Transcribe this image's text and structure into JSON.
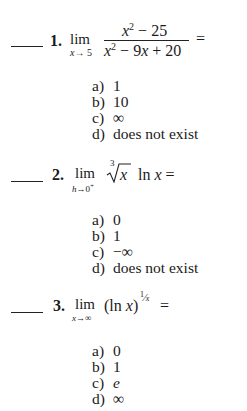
{
  "questions": [
    {
      "number": "1.",
      "answer_blank": "",
      "limit": {
        "word": "lim",
        "approach_var": "x",
        "arrow": "→",
        "approach_to": "5"
      },
      "expression": {
        "type": "fraction",
        "numerator": {
          "var": "x",
          "exp": "2",
          "rest": " − 25"
        },
        "denominator": {
          "var": "x",
          "exp": "2",
          "rest1": " − 9",
          "var2": "x",
          "rest2": " + 20"
        }
      },
      "equals": "=",
      "choices": [
        {
          "label": "a)",
          "value": "1"
        },
        {
          "label": "b)",
          "value": "10"
        },
        {
          "label": "c)",
          "value": "∞"
        },
        {
          "label": "d)",
          "value": "does not exist"
        }
      ]
    },
    {
      "number": "2.",
      "answer_blank": "",
      "limit": {
        "word": "lim",
        "approach_var": "h",
        "arrow": "→",
        "approach_to": "0",
        "side": "+"
      },
      "expression": {
        "type": "radical-log",
        "root_index": "3",
        "radicand": "x",
        "log_fn": "ln",
        "log_arg": "x"
      },
      "equals": "=",
      "choices": [
        {
          "label": "a)",
          "value": "0"
        },
        {
          "label": "b)",
          "value": "1"
        },
        {
          "label": "c)",
          "value": "−∞"
        },
        {
          "label": "d)",
          "value": "does not exist"
        }
      ]
    },
    {
      "number": "3.",
      "answer_blank": "",
      "limit": {
        "word": "lim",
        "approach_var": "x",
        "arrow": "→",
        "approach_to": "∞"
      },
      "expression": {
        "type": "power",
        "base_open": "(",
        "log_fn": "ln",
        "log_arg": "x",
        "base_close": ")",
        "exp_num": "1",
        "exp_slash": "⁄",
        "exp_den": "x"
      },
      "equals": "=",
      "choices": [
        {
          "label": "a)",
          "value": "0"
        },
        {
          "label": "b)",
          "value": "1"
        },
        {
          "label": "c)",
          "value": "e",
          "italic": true
        },
        {
          "label": "d)",
          "value": "∞"
        }
      ]
    }
  ]
}
